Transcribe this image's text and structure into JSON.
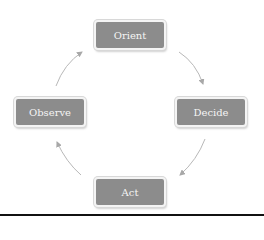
{
  "diagram": {
    "type": "cycle",
    "title": "",
    "nodes": [
      {
        "id": "orient",
        "label": "Orient"
      },
      {
        "id": "decide",
        "label": "Decide"
      },
      {
        "id": "act",
        "label": "Act"
      },
      {
        "id": "observe",
        "label": "Observe"
      }
    ],
    "edges": [
      {
        "from": "observe",
        "to": "orient"
      },
      {
        "from": "orient",
        "to": "decide"
      },
      {
        "from": "decide",
        "to": "act"
      },
      {
        "from": "act",
        "to": "observe"
      }
    ],
    "colors": {
      "node_fill": "#8c8c8c",
      "node_border": "#f4f4f4",
      "node_text": "#f5f5f5",
      "arrow": "#b0b0b0",
      "rule": "#111111"
    }
  }
}
